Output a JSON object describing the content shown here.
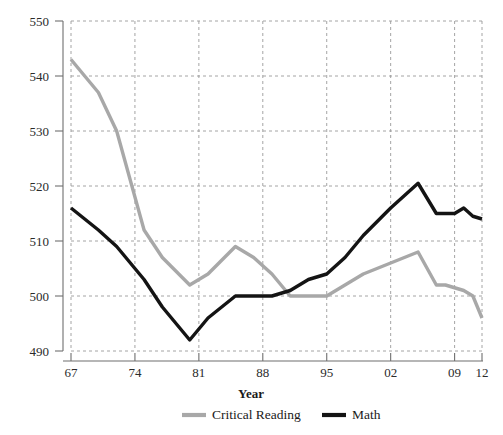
{
  "chart_data": {
    "type": "line",
    "title": "",
    "xlabel": "Year",
    "ylabel": "",
    "xlim": [
      1967,
      2012
    ],
    "ylim": [
      490,
      550
    ],
    "grid": true,
    "legend_position": "bottom",
    "x_tick_labels": [
      "67",
      "74",
      "81",
      "88",
      "95",
      "02",
      "09",
      "12"
    ],
    "x_tick_values": [
      1967,
      1974,
      1981,
      1988,
      1995,
      2002,
      2009,
      2012
    ],
    "y_tick_labels": [
      "490",
      "500",
      "510",
      "520",
      "530",
      "540",
      "550"
    ],
    "y_tick_values": [
      490,
      500,
      510,
      520,
      530,
      540,
      550
    ],
    "series": [
      {
        "name": "Critical Reading",
        "color": "#a8a8a8",
        "x": [
          1967,
          1970,
          1972,
          1975,
          1977,
          1980,
          1982,
          1985,
          1987,
          1989,
          1991,
          1993,
          1995,
          1997,
          1999,
          2002,
          2005,
          2007,
          2008,
          2010,
          2011,
          2012
        ],
        "values": [
          543,
          537,
          530,
          512,
          507,
          502,
          504,
          509,
          507,
          504,
          500,
          500,
          500,
          502,
          504,
          506,
          508,
          502,
          502,
          501,
          500,
          496
        ]
      },
      {
        "name": "Math",
        "color": "#141414",
        "x": [
          1967,
          1970,
          1972,
          1975,
          1977,
          1980,
          1982,
          1985,
          1987,
          1989,
          1991,
          1993,
          1995,
          1997,
          1999,
          2002,
          2005,
          2007,
          2009,
          2010,
          2011,
          2012
        ],
        "values": [
          516,
          512,
          509,
          503,
          498,
          492,
          496,
          500,
          500,
          500,
          501,
          503,
          504,
          507,
          511,
          516,
          520.5,
          515,
          515,
          516,
          514.5,
          514
        ]
      }
    ]
  },
  "legend": {
    "items": [
      {
        "label": "Critical Reading",
        "color": "#a8a8a8"
      },
      {
        "label": "Math",
        "color": "#141414"
      }
    ]
  },
  "axes": {
    "x_title": "Year"
  }
}
